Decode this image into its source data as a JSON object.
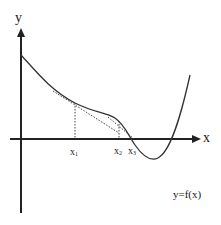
{
  "diagram": {
    "axes": {
      "x_label": "x",
      "y_label": "y"
    },
    "points": [
      {
        "id": "x1",
        "base": "x",
        "sub": "1"
      },
      {
        "id": "x2",
        "base": "x",
        "sub": "2"
      },
      {
        "id": "x3",
        "base": "x",
        "sub": "3"
      }
    ],
    "function_label": "y=f(x)",
    "colors": {
      "curve": "#333333",
      "axis": "#222222",
      "dotted": "#444444",
      "background": "#ffffff"
    }
  }
}
